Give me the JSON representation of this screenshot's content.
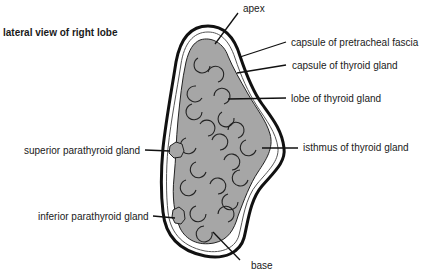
{
  "diagram": {
    "title": "lateral view of right lobe",
    "colors": {
      "gland_fill": "#a6a6a6",
      "outline": "#111111",
      "background": "#ffffff"
    },
    "labels": {
      "apex": "apex",
      "capsule_pretracheal": "capsule of pretracheal fascia",
      "capsule_thyroid": "capsule of thyroid gland",
      "lobe": "lobe of thyroid gland",
      "isthmus": "isthmus of thyroid gland",
      "superior_parathyroid": "superior parathyroid gland",
      "inferior_parathyroid": "inferior parathyroid gland",
      "base": "base"
    }
  }
}
